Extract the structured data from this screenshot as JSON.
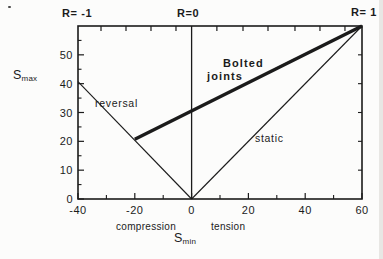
{
  "figure": {
    "background": "#fcfcfb",
    "ink": "#1b1b1b"
  },
  "chart_data": {
    "type": "line",
    "title": "",
    "xlabel": {
      "base": "S",
      "sub": "min"
    },
    "ylabel": {
      "base": "S",
      "sub": "max"
    },
    "x_region_labels": {
      "left": "compression",
      "right": "tension"
    },
    "xlim": [
      -40,
      60
    ],
    "ylim": [
      0,
      60
    ],
    "grid": false,
    "x_major_ticks": [
      -40,
      -20,
      0,
      20,
      40,
      60
    ],
    "x_major_tick_labels": [
      "-40",
      "-20",
      "0",
      "20",
      "40",
      "60"
    ],
    "x_minor_ticks": [
      -30,
      -10,
      10,
      30,
      50
    ],
    "y_major_ticks": [
      0,
      10,
      20,
      30,
      40,
      50
    ],
    "y_major_tick_labels": [
      "0",
      "10",
      "20",
      "30",
      "40",
      "50"
    ],
    "y_minor_ticks": [
      5,
      15,
      25,
      35,
      45,
      55
    ],
    "top_edge_ticks": [
      -31.9,
      -23.1,
      -14.3,
      -5.5,
      8.9,
      18.1,
      26.9,
      36.4,
      45.2,
      54.0
    ],
    "right_edge_ticks": [
      10,
      20,
      30,
      40,
      50
    ],
    "series": [
      {
        "name": "r0-boundary",
        "label": "R=0",
        "points": [
          [
            0,
            0
          ],
          [
            0,
            60
          ]
        ],
        "width": 1.3,
        "role": "reference"
      },
      {
        "name": "reversal",
        "label": "reversal",
        "points": [
          [
            -40,
            40.7
          ],
          [
            0,
            0
          ]
        ],
        "width": 1.1,
        "role": "reference"
      },
      {
        "name": "static",
        "label": "static",
        "points": [
          [
            0,
            0
          ],
          [
            60,
            60
          ]
        ],
        "width": 1.1,
        "role": "reference"
      },
      {
        "name": "bolted-joints",
        "label": "Bolted joints",
        "points": [
          [
            -20,
            20.7
          ],
          [
            60,
            60
          ]
        ],
        "width": 3.4,
        "role": "data"
      }
    ],
    "annotations": {
      "r_minus_one": "R= -1",
      "r_zero": "R=0",
      "r_one": "R= 1",
      "reversal": "reversal",
      "static": "static",
      "bolted_line1": "Bolted",
      "bolted_line2": "joints",
      "compression": "compression",
      "tension": "tension"
    }
  }
}
